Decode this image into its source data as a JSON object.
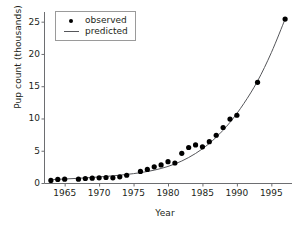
{
  "chart_data": {
    "type": "scatter",
    "title": "",
    "xlabel": "Year",
    "ylabel": "Pup count (thousands)",
    "xlim": [
      1962,
      1998
    ],
    "ylim": [
      0,
      26.5
    ],
    "grid": false,
    "legend_position": "top-left",
    "xticks": [
      1965,
      1970,
      1975,
      1980,
      1985,
      1990,
      1995
    ],
    "yticks": [
      0,
      5,
      10,
      15,
      20,
      25
    ],
    "series": [
      {
        "name": "observed",
        "marker": "filled-circle",
        "color": "#000000",
        "x": [
          1963,
          1964,
          1965,
          1967,
          1968,
          1969,
          1970,
          1971,
          1972,
          1973,
          1974,
          1976,
          1977,
          1978,
          1979,
          1980,
          1981,
          1982,
          1983,
          1984,
          1985,
          1986,
          1987,
          1988,
          1989,
          1990,
          1993,
          1997
        ],
        "values": [
          0.4,
          0.55,
          0.6,
          0.6,
          0.7,
          0.75,
          0.8,
          0.85,
          0.8,
          0.95,
          1.2,
          1.8,
          2.1,
          2.5,
          2.8,
          3.3,
          3.1,
          4.6,
          5.5,
          5.9,
          5.6,
          6.4,
          7.4,
          8.6,
          9.9,
          10.5,
          15.6,
          25.4
        ]
      },
      {
        "name": "predicted",
        "marker": "line",
        "color": "#55565a",
        "x": [
          1963,
          1965,
          1967,
          1969,
          1971,
          1973,
          1975,
          1977,
          1979,
          1981,
          1983,
          1985,
          1987,
          1989,
          1991,
          1993,
          1995,
          1997
        ],
        "values": [
          0.52,
          0.62,
          0.73,
          0.86,
          1.02,
          1.21,
          1.45,
          1.78,
          2.25,
          2.95,
          3.95,
          5.3,
          7.1,
          9.4,
          12.3,
          15.8,
          20.2,
          25.4
        ]
      }
    ]
  },
  "legend": {
    "observed_label": "observed",
    "predicted_label": "predicted"
  }
}
